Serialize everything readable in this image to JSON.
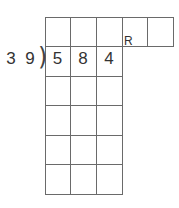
{
  "division": {
    "divisor": [
      "3",
      "9"
    ],
    "dividend": [
      "5",
      "8",
      "4"
    ],
    "remainder_label": "R",
    "bracket": ")"
  },
  "grid": {
    "columns_x": [
      45,
      70,
      96,
      122,
      147,
      173
    ],
    "rows_y": [
      17,
      46,
      76,
      105,
      135,
      164,
      194
    ],
    "top_row_columns": 5,
    "body_columns": 3
  }
}
